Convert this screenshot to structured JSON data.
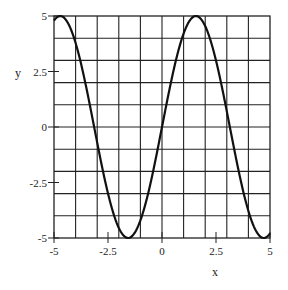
{
  "chart_data": {
    "type": "line",
    "title": "",
    "xlabel": "x",
    "ylabel": "y",
    "xlim": [
      -5,
      5
    ],
    "ylim": [
      -5,
      5
    ],
    "grid": true,
    "grid_step_x": 1,
    "grid_step_y": 1,
    "x_ticks": [
      -5,
      -2.5,
      0,
      2.5,
      5
    ],
    "x_tick_labels": [
      "-5",
      "-2.5",
      "0",
      "2.5",
      "5"
    ],
    "y_ticks": [
      5,
      2.5,
      0,
      -2.5,
      -5
    ],
    "y_tick_labels": [
      "5",
      "2.5",
      "0",
      "-2.5",
      "-5"
    ],
    "series": [
      {
        "name": "5·sin(x)",
        "function": "5*sin(x)",
        "x": [
          -5,
          -4.5,
          -4,
          -3.5,
          -3,
          -2.5,
          -2,
          -1.5,
          -1,
          -0.5,
          0,
          0.5,
          1,
          1.5,
          2,
          2.5,
          3,
          3.5,
          4,
          4.5,
          5
        ],
        "values": [
          4.79,
          4.89,
          3.78,
          1.75,
          -0.71,
          -2.99,
          -4.55,
          -4.99,
          -4.21,
          -2.4,
          0,
          2.4,
          4.21,
          4.99,
          4.55,
          2.99,
          0.71,
          -1.75,
          -3.78,
          -4.89,
          -4.79
        ]
      }
    ],
    "colors": {
      "line": "#111111",
      "grid": "#222222",
      "frame": "#222222"
    }
  }
}
